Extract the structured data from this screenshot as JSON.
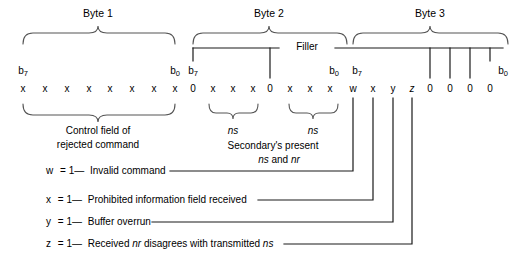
{
  "diagram": {
    "byte_groups": [
      {
        "name": "byte-1",
        "label": "Byte 1",
        "msb": "b7",
        "lsb": "b0",
        "bits": [
          "x",
          "x",
          "x",
          "x",
          "x",
          "x",
          "x",
          "x"
        ],
        "caption_line1": "Control field of",
        "caption_line2": "rejected command"
      },
      {
        "name": "byte-2",
        "label": "Byte 2",
        "msb": "b7",
        "lsb": "b0",
        "bits": [
          "0",
          "x",
          "x",
          "x",
          "0",
          "x",
          "x",
          "x"
        ],
        "sub_labels": [
          "ns",
          "ns"
        ],
        "caption_line1": "Secondary's present",
        "caption_line2": "ns and nr"
      },
      {
        "name": "byte-3",
        "label": "Byte 3",
        "msb": "b7",
        "lsb": "b0",
        "bits": [
          "w",
          "x",
          "y",
          "z",
          "0",
          "0",
          "0",
          "0"
        ]
      }
    ],
    "filler_label": "Filler",
    "legend": [
      {
        "key": "w",
        "eq": "= 1—",
        "text": "Invalid command"
      },
      {
        "key": "x",
        "eq": "= 1—",
        "text": "Prohibited information field received"
      },
      {
        "key": "y",
        "eq": "= 1—",
        "text": "Buffer overrun"
      },
      {
        "key": "z",
        "eq": "= 1—",
        "text_pre": "Received ",
        "text_em1": "nr",
        "text_mid": " disagrees with transmitted ",
        "text_em2": "ns"
      }
    ],
    "colors": {
      "line": "#1a1a1a",
      "brace": "#555555",
      "background": "#ffffff",
      "text": "#000000"
    }
  }
}
